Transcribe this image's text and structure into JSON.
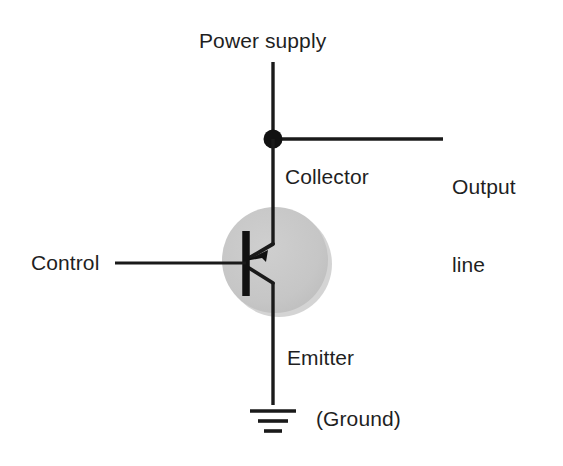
{
  "diagram": {
    "title_text": "Transistor switch circuit",
    "labels": {
      "power_supply": "Power supply",
      "output_line_1": "Output",
      "output_line_2": "line",
      "collector": "Collector",
      "control": "Control",
      "emitter": "Emitter",
      "ground": "(Ground)"
    },
    "colors": {
      "background": "#ffffff",
      "wire": "#1a1a1a",
      "text": "#1f1f1f",
      "transistor_body": "#c6c6c6",
      "transistor_shadow": "#b4b4b4"
    },
    "components": {
      "supply_wire_name": "power-supply-wire",
      "junction_dot_name": "collector-junction-dot",
      "output_wire_name": "output-line-wire",
      "collector_wire_name": "collector-wire",
      "base_wire_name": "control-base-wire",
      "emitter_wire_name": "emitter-wire",
      "transistor_name": "transistor-symbol",
      "ground_name": "ground-symbol"
    }
  }
}
